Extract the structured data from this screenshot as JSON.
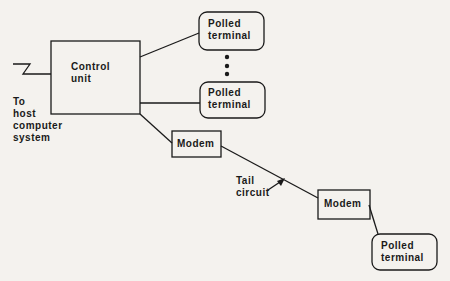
{
  "diagram": {
    "control_unit": {
      "line1": "Control",
      "line2": "unit"
    },
    "host_label": {
      "line1": "To",
      "line2": "host",
      "line3": "computer",
      "line4": "system"
    },
    "terminals": [
      {
        "line1": "Polled",
        "line2": "terminal"
      },
      {
        "line1": "Polled",
        "line2": "terminal"
      },
      {
        "line1": "Polled",
        "line2": "terminal"
      }
    ],
    "modems": [
      {
        "label": "Modem"
      },
      {
        "label": "Modem"
      }
    ],
    "tail_circuit": {
      "line1": "Tail",
      "line2": "circuit"
    },
    "ellipsis_dots": 3,
    "colors": {
      "line": "#1a1a1a",
      "background": "#f4f2ee"
    }
  }
}
